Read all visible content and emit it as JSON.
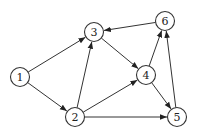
{
  "diagram": {
    "type": "directed-graph",
    "node_radius": 9.5,
    "colors": {
      "stroke": "#333333",
      "fill": "#ffffff",
      "label": "#222222"
    },
    "nodes": [
      {
        "id": "1",
        "label": "1",
        "x": 20,
        "y": 77
      },
      {
        "id": "2",
        "label": "2",
        "x": 75,
        "y": 117
      },
      {
        "id": "3",
        "label": "3",
        "x": 94,
        "y": 32
      },
      {
        "id": "4",
        "label": "4",
        "x": 146,
        "y": 75
      },
      {
        "id": "5",
        "label": "5",
        "x": 177,
        "y": 117
      },
      {
        "id": "6",
        "label": "6",
        "x": 165,
        "y": 21
      }
    ],
    "edges": [
      {
        "from": "1",
        "to": "3"
      },
      {
        "from": "1",
        "to": "2"
      },
      {
        "from": "2",
        "to": "3"
      },
      {
        "from": "2",
        "to": "4"
      },
      {
        "from": "2",
        "to": "5"
      },
      {
        "from": "3",
        "to": "4"
      },
      {
        "from": "4",
        "to": "6"
      },
      {
        "from": "4",
        "to": "5"
      },
      {
        "from": "5",
        "to": "6"
      },
      {
        "from": "6",
        "to": "3"
      }
    ]
  }
}
